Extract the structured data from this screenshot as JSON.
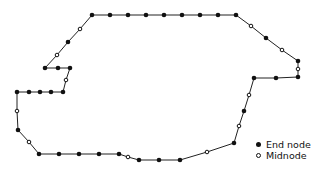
{
  "diagram": {
    "type": "mesh-boundary-outline",
    "line_color": "#222222",
    "node_color": "#111111",
    "polygon": [
      [
        92,
        15
      ],
      [
        110,
        15
      ],
      [
        128,
        15
      ],
      [
        146,
        15
      ],
      [
        164,
        15
      ],
      [
        182,
        15
      ],
      [
        200,
        15
      ],
      [
        218,
        15
      ],
      [
        236,
        15
      ],
      [
        251,
        26
      ],
      [
        266,
        38
      ],
      [
        282,
        50
      ],
      [
        298,
        61
      ],
      [
        298,
        69
      ],
      [
        298,
        77
      ],
      [
        276,
        78
      ],
      [
        254,
        78
      ],
      [
        249,
        95
      ],
      [
        244,
        111
      ],
      [
        239,
        126
      ],
      [
        234,
        143
      ],
      [
        207,
        152
      ],
      [
        180,
        160
      ],
      [
        159,
        160
      ],
      [
        139,
        160
      ],
      [
        128,
        157
      ],
      [
        119,
        154
      ],
      [
        99,
        154
      ],
      [
        79,
        154
      ],
      [
        59,
        154
      ],
      [
        39,
        154
      ],
      [
        29,
        142
      ],
      [
        18,
        130
      ],
      [
        17,
        111
      ],
      [
        17,
        92
      ],
      [
        29,
        92
      ],
      [
        40,
        92
      ],
      [
        51,
        92
      ],
      [
        63,
        92
      ],
      [
        66,
        80
      ],
      [
        70,
        68
      ],
      [
        58,
        68
      ],
      [
        45,
        68
      ],
      [
        57,
        55
      ],
      [
        68,
        42
      ],
      [
        80,
        29
      ]
    ],
    "end_nodes": [
      [
        92,
        15
      ],
      [
        110,
        15
      ],
      [
        128,
        15
      ],
      [
        146,
        15
      ],
      [
        164,
        15
      ],
      [
        182,
        15
      ],
      [
        200,
        15
      ],
      [
        218,
        15
      ],
      [
        236,
        15
      ],
      [
        266,
        38
      ],
      [
        298,
        61
      ],
      [
        298,
        77
      ],
      [
        276,
        78
      ],
      [
        254,
        78
      ],
      [
        244,
        111
      ],
      [
        234,
        143
      ],
      [
        180,
        160
      ],
      [
        159,
        160
      ],
      [
        139,
        160
      ],
      [
        119,
        154
      ],
      [
        99,
        154
      ],
      [
        79,
        154
      ],
      [
        59,
        154
      ],
      [
        39,
        154
      ],
      [
        18,
        130
      ],
      [
        17,
        92
      ],
      [
        29,
        92
      ],
      [
        40,
        92
      ],
      [
        51,
        92
      ],
      [
        63,
        92
      ],
      [
        70,
        68
      ],
      [
        58,
        68
      ],
      [
        45,
        68
      ],
      [
        68,
        42
      ]
    ],
    "mid_nodes": [
      [
        251,
        26
      ],
      [
        282,
        50
      ],
      [
        298,
        69
      ],
      [
        249,
        95
      ],
      [
        239,
        126
      ],
      [
        207,
        152
      ],
      [
        128,
        157
      ],
      [
        29,
        142
      ],
      [
        17,
        111
      ],
      [
        66,
        80
      ],
      [
        57,
        55
      ],
      [
        80,
        29
      ]
    ]
  },
  "legend": {
    "items": [
      {
        "symbol": "filled-dot",
        "label": "End node"
      },
      {
        "symbol": "hollow-dot",
        "label": "Midnode"
      }
    ]
  }
}
